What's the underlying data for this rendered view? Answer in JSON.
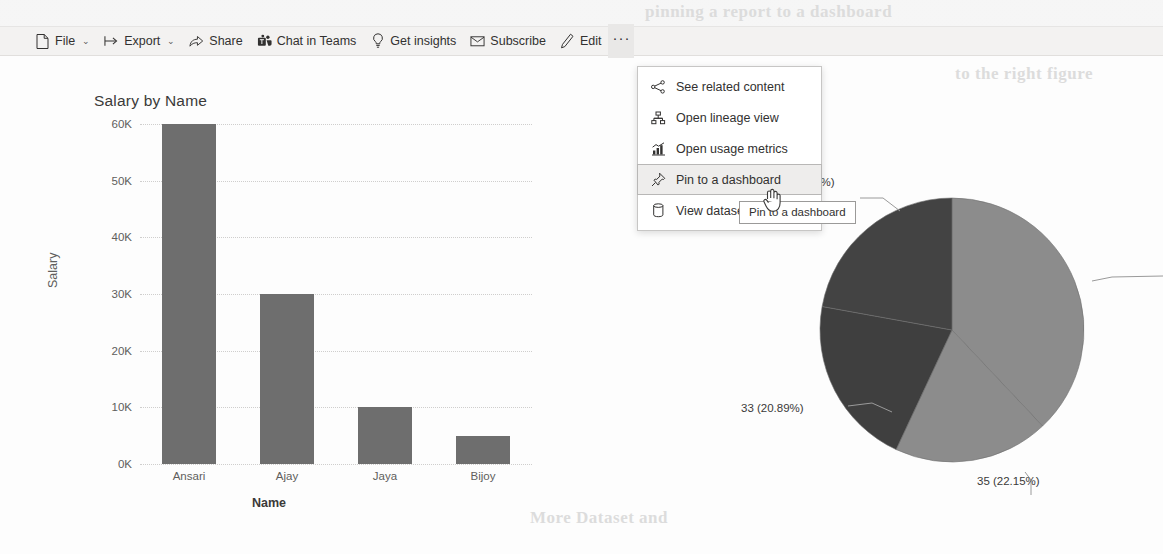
{
  "toolbar": {
    "items": [
      {
        "id": "file",
        "label": "File",
        "icon": "file-icon",
        "chevron": "⌄"
      },
      {
        "id": "export",
        "label": "Export",
        "icon": "export-icon",
        "chevron": "⌄"
      },
      {
        "id": "share",
        "label": "Share",
        "icon": "share-icon",
        "chevron": ""
      },
      {
        "id": "chat-in-teams",
        "label": "Chat in Teams",
        "icon": "teams-icon",
        "chevron": ""
      },
      {
        "id": "get-insights",
        "label": "Get insights",
        "icon": "lightbulb-icon",
        "chevron": ""
      },
      {
        "id": "subscribe",
        "label": "Subscribe",
        "icon": "envelope-icon",
        "chevron": ""
      },
      {
        "id": "edit",
        "label": "Edit",
        "icon": "pencil-icon",
        "chevron": ""
      }
    ],
    "more_label": "···"
  },
  "menu": {
    "items": [
      {
        "id": "see-related-content",
        "label": "See related content",
        "icon": "share-nodes-icon",
        "selected": false
      },
      {
        "id": "open-lineage-view",
        "label": "Open lineage view",
        "icon": "lineage-icon",
        "selected": false
      },
      {
        "id": "open-usage-metrics",
        "label": "Open usage metrics",
        "icon": "usage-metrics-icon",
        "selected": false
      },
      {
        "id": "pin-to-a-dashboard",
        "label": "Pin to a dashboard",
        "icon": "pin-icon",
        "selected": true
      },
      {
        "id": "view-dataset",
        "label": "View dataset",
        "icon": "dataset-icon",
        "selected": false
      }
    ]
  },
  "tooltip": {
    "text": "Pin to a dashboard"
  },
  "chart_data": [
    {
      "type": "bar",
      "title": "Salary by Name",
      "xlabel": "Name",
      "ylabel": "Salary",
      "categories": [
        "Ansari",
        "Ajay",
        "Jaya",
        "Bijoy"
      ],
      "values": [
        60000,
        30000,
        10000,
        5000
      ],
      "ylim": [
        0,
        60000
      ],
      "yticks": [
        0,
        10000,
        20000,
        30000,
        40000,
        50000,
        60000
      ],
      "ytick_labels": [
        "0K",
        "10K",
        "20K",
        "30K",
        "40K",
        "50K",
        "60K"
      ],
      "grid": true,
      "legend": "none",
      "bar_color": "#6e6e6e"
    },
    {
      "type": "pie",
      "title": "",
      "labels": [
        "(18.99%)",
        "33 (20.89%)",
        "35 (22.15%)",
        ""
      ],
      "values": [
        37.97,
        18.99,
        20.89,
        22.15
      ],
      "slice_labels": [
        "",
        "(18.99%)",
        "33 (20.89%)",
        "35 (22.15%)"
      ],
      "slice_colors": [
        "#8c8c8c",
        "#8c8c8c",
        "#3f3f3f",
        "#434343"
      ],
      "legend": "none",
      "annotations": [
        {
          "text": "(18.99%)",
          "position": "upper-left"
        },
        {
          "text": "33 (20.89%)",
          "position": "left"
        },
        {
          "text": "35 (22.15%)",
          "position": "bottom"
        }
      ]
    }
  ],
  "ghost": {
    "line1": "pinning a report to a dashboard",
    "line2": "to the right figure",
    "line3": "More Dataset and"
  }
}
